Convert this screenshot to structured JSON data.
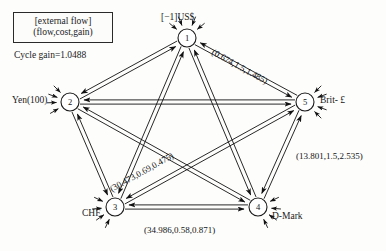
{
  "legend": {
    "line1": "[external flow]",
    "line2": "(flow,cost,gain)",
    "cycle_gain": "Cycle gain=1.0488"
  },
  "nodes": [
    {
      "id": "1",
      "number": "1",
      "label": "[−1]US$",
      "cx": 187,
      "cy": 38,
      "r": 9,
      "label_x": 161,
      "label_y": 12,
      "ext_flow": true
    },
    {
      "id": "2",
      "number": "2",
      "label": "Yen(100)",
      "cx": 70,
      "cy": 102,
      "r": 9,
      "label_x": 12,
      "label_y": 95,
      "ext_flow": true
    },
    {
      "id": "3",
      "number": "3",
      "label": "CHF",
      "cx": 115,
      "cy": 207,
      "r": 9,
      "label_x": 82,
      "label_y": 208,
      "ext_flow": true
    },
    {
      "id": "4",
      "number": "4",
      "label": "D-Mark",
      "cx": 258,
      "cy": 207,
      "r": 9,
      "label_x": 272,
      "label_y": 211,
      "ext_flow": true
    },
    {
      "id": "5",
      "number": "5",
      "label": "Brit- £",
      "cx": 305,
      "cy": 102,
      "r": 9,
      "label_x": 320,
      "label_y": 95,
      "ext_flow": true
    }
  ],
  "edges": [
    {
      "from": "1",
      "to": "2",
      "bidirectional": true
    },
    {
      "from": "1",
      "to": "3",
      "bidirectional": true
    },
    {
      "from": "1",
      "to": "4",
      "bidirectional": true
    },
    {
      "from": "1",
      "to": "5",
      "bidirectional": true
    },
    {
      "from": "2",
      "to": "3",
      "bidirectional": true
    },
    {
      "from": "2",
      "to": "4",
      "bidirectional": true
    },
    {
      "from": "2",
      "to": "5",
      "bidirectional": true
    },
    {
      "from": "3",
      "to": "4",
      "bidirectional": true
    },
    {
      "from": "3",
      "to": "5",
      "bidirectional": true
    },
    {
      "from": "4",
      "to": "5",
      "bidirectional": true
    }
  ],
  "edge_labels": [
    {
      "id": "label-1-5",
      "text": "(0.674,1.5,1.485)",
      "x": 215,
      "y": 47,
      "rotate": 29
    },
    {
      "id": "label-3-5",
      "text": "(30.473,0.69,0.475)",
      "x": 108,
      "y": 185,
      "rotate": -29
    },
    {
      "id": "label-4-5",
      "text": "(13.801,1.5,2.535)",
      "x": 296,
      "y": 151,
      "rotate": 0
    },
    {
      "id": "label-3-4",
      "text": "(34.986,0.58,0.871)",
      "x": 144,
      "y": 225,
      "rotate": 0
    }
  ],
  "chart_data": {
    "type": "diagram",
    "annotations": {
      "legend_top": "[external flow]",
      "legend_bottom": "(flow,cost,gain)",
      "cycle_gain": "Cycle gain=1.0488"
    },
    "vertices": [
      "1 [−1]US$",
      "2 Yen(100)",
      "3 CHF",
      "4 D-Mark",
      "5 Brit- £"
    ],
    "labeled_arcs": [
      {
        "arc": "1-5",
        "flow": 0.674,
        "cost": 1.5,
        "gain": 1.485
      },
      {
        "arc": "3-5",
        "flow": 30.473,
        "cost": 0.69,
        "gain": 0.475
      },
      {
        "arc": "4-5",
        "flow": 13.801,
        "cost": 1.5,
        "gain": 2.535
      },
      {
        "arc": "3-4",
        "flow": 34.986,
        "cost": 0.58,
        "gain": 0.871
      }
    ]
  }
}
